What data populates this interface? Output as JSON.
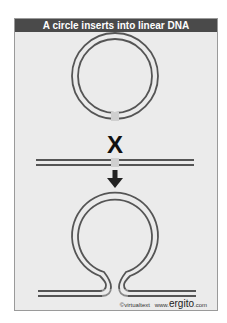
{
  "title": "A circle inserts into linear DNA",
  "labels": {
    "crossover_mark": "X",
    "arrow": "down-arrow"
  },
  "credit": {
    "copyright": "©virtualtext",
    "www": "www.",
    "brand": "ergito",
    "tld": ".com"
  },
  "colors": {
    "header_bg": "#4a4a4a",
    "panel_bg": "#ebebeb",
    "strand": "#555555",
    "mark": "#111111"
  }
}
